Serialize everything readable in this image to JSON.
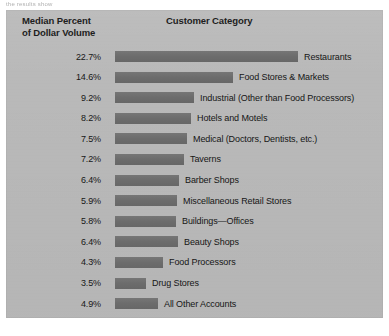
{
  "page": {
    "top_caption": "the results show"
  },
  "panel": {
    "background_color": "#b9b9b9",
    "bar_color": "#6f6f6f"
  },
  "header": {
    "left_line1": "Median Percent",
    "left_line2": "of Dollar Volume",
    "center": "Customer Category"
  },
  "chart_data": {
    "type": "bar",
    "title": "Customer Category",
    "xlabel": "",
    "ylabel": "Median Percent of Dollar Volume",
    "orientation": "horizontal",
    "grid": false,
    "legend": "none",
    "value_label_suffix": "%",
    "categories": [
      "Restaurants",
      "Food Stores & Markets",
      "Industrial (Other than Food Processors)",
      "Hotels and Motels",
      "Medical (Doctors, Dentists, etc.)",
      "Taverns",
      "Barber Shops",
      "Miscellaneous Retail Stores",
      "Buildings—Offices",
      "Beauty Shops",
      "Food Processors",
      "Drug Stores",
      "All Other Accounts"
    ],
    "values": [
      22.7,
      14.6,
      9.2,
      8.2,
      7.5,
      7.2,
      6.4,
      5.9,
      5.8,
      6.4,
      4.3,
      3.5,
      4.9
    ],
    "value_labels": [
      "22.7%",
      "14.6%",
      "9.2%",
      "8.2%",
      "7.5%",
      "7.2%",
      "6.4%",
      "5.9%",
      "5.8%",
      "6.4%",
      "4.3%",
      "3.5%",
      "4.9%"
    ],
    "bar_pixel_widths": [
      183,
      118,
      79,
      76,
      72,
      69,
      64,
      62,
      61,
      63,
      48,
      31,
      43
    ],
    "ylim": [
      0,
      22.7
    ]
  }
}
